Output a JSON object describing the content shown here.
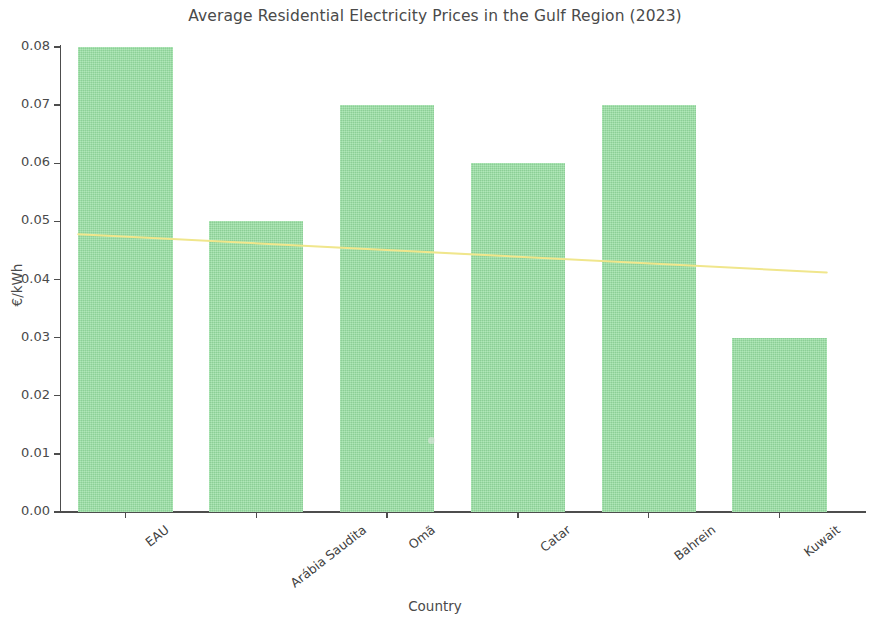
{
  "chart_data": {
    "type": "bar",
    "title": "Average Residential Electricity Prices in the Gulf Region (2023)",
    "xlabel": "Country",
    "ylabel": "€/kWh",
    "categories": [
      "EAU",
      "Arábia Saudita",
      "Omã",
      "Catar",
      "Bahrein",
      "Kuwait"
    ],
    "values": [
      0.08,
      0.05,
      0.07,
      0.06,
      0.07,
      0.03
    ],
    "ylim": [
      0.0,
      0.08
    ],
    "ytick_labels": [
      "0.00",
      "0.01",
      "0.02",
      "0.03",
      "0.04",
      "0.05",
      "0.06",
      "0.07",
      "0.08"
    ],
    "ytick_values": [
      0.0,
      0.01,
      0.02,
      0.03,
      0.04,
      0.05,
      0.06,
      0.07,
      0.08
    ],
    "grid": false,
    "legend": "none",
    "bar_color": "#98e0a3",
    "series": [
      {
        "name": "Average price",
        "type": "bar",
        "values": [
          0.08,
          0.05,
          0.07,
          0.06,
          0.07,
          0.03
        ]
      },
      {
        "name": "Trend line",
        "type": "line",
        "color": "#f0e68c",
        "x": [
          "EAU",
          "Kuwait"
        ],
        "values": [
          0.0478,
          0.0412
        ]
      }
    ]
  },
  "figure": {
    "title": "Average Residential Electricity Prices in the Gulf Region (2023)",
    "x_axis_title": "Country",
    "y_axis_title": "€/kWh",
    "background_color": "#ffffff",
    "axis_color": "#4d4d4d",
    "text_color": "#4a4a4a"
  }
}
